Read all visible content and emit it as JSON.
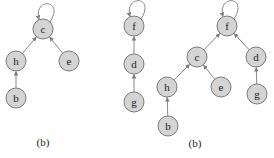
{
  "figures": [
    {
      "id": "left",
      "caption": "(b)",
      "caption_pos": [
        43,
        146
      ],
      "nodes": [
        {
          "id": "c",
          "label": "c",
          "x": 43,
          "y": 29,
          "self_loop": true
        },
        {
          "id": "h",
          "label": "h",
          "x": 16,
          "y": 61
        },
        {
          "id": "e",
          "label": "e",
          "x": 69,
          "y": 61
        },
        {
          "id": "b",
          "label": "b",
          "x": 16,
          "y": 98
        }
      ],
      "edges": [
        {
          "from": "h",
          "to": "c"
        },
        {
          "from": "e",
          "to": "c"
        },
        {
          "from": "b",
          "to": "h"
        }
      ]
    },
    {
      "id": "middle",
      "caption": "",
      "nodes": [
        {
          "id": "f",
          "label": "f",
          "x": 134,
          "y": 26,
          "self_loop": true
        },
        {
          "id": "d",
          "label": "d",
          "x": 134,
          "y": 64
        },
        {
          "id": "g",
          "label": "g",
          "x": 134,
          "y": 102
        }
      ],
      "edges": [
        {
          "from": "d",
          "to": "f"
        },
        {
          "from": "g",
          "to": "d"
        }
      ]
    },
    {
      "id": "right",
      "caption": "(b)",
      "caption_pos": [
        195,
        147
      ],
      "nodes": [
        {
          "id": "f",
          "label": "f",
          "x": 227,
          "y": 26,
          "self_loop": true
        },
        {
          "id": "c",
          "label": "c",
          "x": 197,
          "y": 57
        },
        {
          "id": "d",
          "label": "d",
          "x": 256,
          "y": 57
        },
        {
          "id": "h",
          "label": "h",
          "x": 167,
          "y": 87
        },
        {
          "id": "e",
          "label": "e",
          "x": 221,
          "y": 87
        },
        {
          "id": "g",
          "label": "g",
          "x": 257,
          "y": 94
        },
        {
          "id": "b",
          "label": "b",
          "x": 168,
          "y": 126
        }
      ],
      "edges": [
        {
          "from": "c",
          "to": "f"
        },
        {
          "from": "d",
          "to": "f"
        },
        {
          "from": "h",
          "to": "c"
        },
        {
          "from": "e",
          "to": "c"
        },
        {
          "from": "g",
          "to": "d"
        },
        {
          "from": "b",
          "to": "h"
        }
      ]
    }
  ],
  "style": {
    "node_fill": "#d4d4d4",
    "node_stroke": "#7a7a7a",
    "edge_color": "#7a7a7a",
    "node_radius": 10
  }
}
